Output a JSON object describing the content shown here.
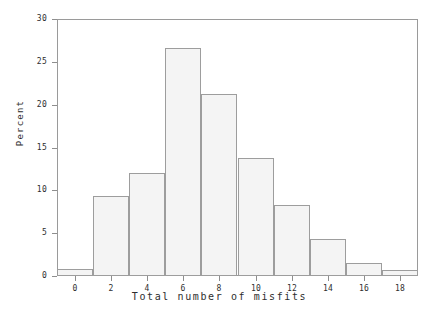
{
  "chart_data": {
    "type": "bar",
    "title": "",
    "subtitle": "",
    "xlabel": "Total number of misfits",
    "ylabel": "Percent",
    "grid": false,
    "legend": "none",
    "xlim": [
      -1,
      19
    ],
    "ylim": [
      0,
      30
    ],
    "xticks": [
      0,
      2,
      4,
      6,
      8,
      10,
      12,
      14,
      16,
      18
    ],
    "xtick_labels": [
      "0",
      "2",
      "4",
      "6",
      "8",
      "10",
      "12",
      "14",
      "16",
      "18"
    ],
    "yticks": [
      0,
      5,
      10,
      15,
      20,
      25,
      30
    ],
    "ytick_labels": [
      "0",
      "5",
      "10",
      "15",
      "20",
      "25",
      "30"
    ],
    "bin_width": 2,
    "bin_edges": [
      -1,
      1,
      3,
      5,
      7,
      9,
      11,
      13,
      15,
      17,
      19
    ],
    "categories": [
      "0",
      "2",
      "4",
      "6",
      "8",
      "10",
      "12",
      "14",
      "16",
      "18"
    ],
    "values": [
      0.8,
      9.3,
      12.0,
      26.6,
      21.2,
      13.8,
      8.3,
      4.3,
      1.5,
      0.7
    ],
    "bars": [
      {
        "center": 0,
        "left": -1,
        "right": 1,
        "value": 0.8
      },
      {
        "center": 2,
        "left": 1,
        "right": 3,
        "value": 9.3
      },
      {
        "center": 4,
        "left": 3,
        "right": 5,
        "value": 12.0
      },
      {
        "center": 6,
        "left": 5,
        "right": 7,
        "value": 26.6
      },
      {
        "center": 8,
        "left": 7,
        "right": 9,
        "value": 21.2
      },
      {
        "center": 10,
        "left": 9,
        "right": 11,
        "value": 13.8
      },
      {
        "center": 12,
        "left": 11,
        "right": 13,
        "value": 8.3
      },
      {
        "center": 14,
        "left": 13,
        "right": 15,
        "value": 4.3
      },
      {
        "center": 16,
        "left": 15,
        "right": 17,
        "value": 1.5
      },
      {
        "center": 18,
        "left": 17,
        "right": 19,
        "value": 0.7
      }
    ],
    "colors": {
      "bar_fill": "#f4f4f4",
      "bar_edge": "#9d9d9d",
      "axis": "#8e8e8e",
      "frame": "#9a9a9a",
      "text": "#2e2e2e",
      "background": "#ffffff"
    }
  }
}
